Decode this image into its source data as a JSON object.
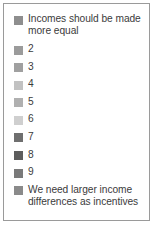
{
  "chart_data": {
    "type": "table",
    "title": "",
    "subtitle": "",
    "xlabel": "",
    "ylabel": "",
    "legend_position": "standalone",
    "grid": false,
    "categories": [
      "Incomes should be made more equal",
      "2",
      "3",
      "4",
      "5",
      "6",
      "7",
      "8",
      "9",
      "We need larger income differences as incentives"
    ],
    "values": [
      1,
      2,
      3,
      4,
      5,
      6,
      7,
      8,
      9,
      10
    ],
    "colors": [
      "#8e8e8e",
      "#9b9b9b",
      "#a0a0a0",
      "#c2c2c2",
      "#b0b0b0",
      "#cfcfcf",
      "#6f6f6f",
      "#5d5d5d",
      "#7a7a7a",
      "#8a8a8a"
    ]
  },
  "legend": {
    "items": [
      {
        "label": "Incomes should be made more equal",
        "color": "#8e8e8e",
        "value": 1
      },
      {
        "label": "2",
        "color": "#9b9b9b",
        "value": 2
      },
      {
        "label": "3",
        "color": "#a0a0a0",
        "value": 3
      },
      {
        "label": "4",
        "color": "#c2c2c2",
        "value": 4
      },
      {
        "label": "5",
        "color": "#b0b0b0",
        "value": 5
      },
      {
        "label": "6",
        "color": "#cfcfcf",
        "value": 6
      },
      {
        "label": "7",
        "color": "#6f6f6f",
        "value": 7
      },
      {
        "label": "8",
        "color": "#5d5d5d",
        "value": 8
      },
      {
        "label": "9",
        "color": "#7a7a7a",
        "value": 9
      },
      {
        "label": "We need larger income differences as incentives",
        "color": "#8a8a8a",
        "value": 10
      }
    ],
    "border_color": "#9a9a9a",
    "background_color": "#ffffff",
    "text_color": "#3b3b3b"
  }
}
